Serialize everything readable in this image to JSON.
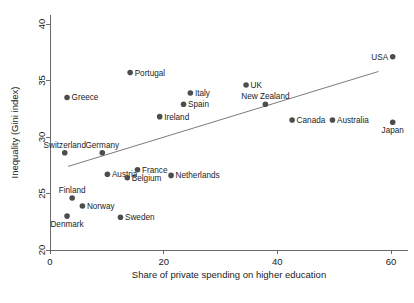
{
  "figure": {
    "top_caption": "",
    "background": "#ffffff",
    "marker_color": "#4d4d4d",
    "axis_color": "#5a5a5a",
    "fit_line_color": "#6d6d6d"
  },
  "chart_data": {
    "type": "scatter",
    "title": "",
    "xlabel": "Share of private spending on higher education",
    "ylabel": "Inequality (Gini index)",
    "xlim": [
      -1.5,
      63
    ],
    "ylim": [
      19.2,
      40.8
    ],
    "xticks": [
      0,
      20,
      40,
      60
    ],
    "xtick_labels": [
      "0",
      "20",
      "40",
      "60"
    ],
    "yticks": [
      20,
      25,
      30,
      35,
      40
    ],
    "ytick_labels": [
      "20",
      "25",
      "30",
      "35",
      "40"
    ],
    "grid": false,
    "legend": null,
    "fit_line": {
      "label": "linear fit",
      "x": [
        3.2,
        57.8
      ],
      "y": [
        27.4,
        35.8
      ]
    },
    "points": [
      {
        "label": "USA",
        "x": 60.3,
        "y": 37.1,
        "label_pos": "left"
      },
      {
        "label": "Portugal",
        "x": 14.1,
        "y": 35.7,
        "label_pos": "right"
      },
      {
        "label": "UK",
        "x": 34.5,
        "y": 34.6,
        "label_pos": "right"
      },
      {
        "label": "Italy",
        "x": 24.7,
        "y": 33.9,
        "label_pos": "right"
      },
      {
        "label": "Greece",
        "x": 3.0,
        "y": 33.5,
        "label_pos": "right"
      },
      {
        "label": "Spain",
        "x": 23.5,
        "y": 32.9,
        "label_pos": "right"
      },
      {
        "label": "New Zealand",
        "x": 37.9,
        "y": 32.9,
        "label_pos": "above"
      },
      {
        "label": "Ireland",
        "x": 19.3,
        "y": 31.8,
        "label_pos": "right"
      },
      {
        "label": "Canada",
        "x": 42.6,
        "y": 31.5,
        "label_pos": "right"
      },
      {
        "label": "Australia",
        "x": 49.7,
        "y": 31.5,
        "label_pos": "right"
      },
      {
        "label": "Japan",
        "x": 60.3,
        "y": 31.3,
        "label_pos": "below"
      },
      {
        "label": "Switzerland",
        "x": 2.6,
        "y": 28.6,
        "label_pos": "above"
      },
      {
        "label": "Germany",
        "x": 9.2,
        "y": 28.6,
        "label_pos": "above"
      },
      {
        "label": "France",
        "x": 15.4,
        "y": 27.1,
        "label_pos": "right"
      },
      {
        "label": "Austria",
        "x": 10.1,
        "y": 26.7,
        "label_pos": "right"
      },
      {
        "label": "Belgium",
        "x": 13.6,
        "y": 26.4,
        "label_pos": "right"
      },
      {
        "label": "Netherlands",
        "x": 21.3,
        "y": 26.6,
        "label_pos": "right"
      },
      {
        "label": "Finland",
        "x": 3.9,
        "y": 24.6,
        "label_pos": "above"
      },
      {
        "label": "Norway",
        "x": 5.7,
        "y": 23.9,
        "label_pos": "right"
      },
      {
        "label": "Denmark",
        "x": 3.0,
        "y": 23.0,
        "label_pos": "below"
      },
      {
        "label": "Sweden",
        "x": 12.4,
        "y": 22.9,
        "label_pos": "right"
      }
    ]
  }
}
